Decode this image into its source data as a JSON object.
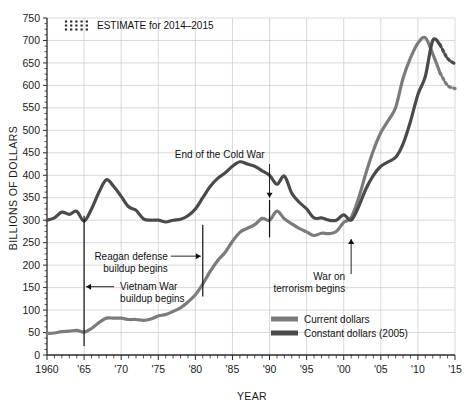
{
  "chart_data": {
    "type": "line",
    "title": "",
    "xlabel": "YEAR",
    "ylabel": "BILLIONS OF DOLLARS",
    "xlim": [
      1960,
      2015
    ],
    "ylim": [
      0,
      750
    ],
    "grid": true,
    "legend_position": "bottom-right",
    "x_tick_labels": [
      "1960",
      "'65",
      "'70",
      "'75",
      "'80",
      "'85",
      "'90",
      "'95",
      "'00",
      "'05",
      "'10",
      "'15"
    ],
    "x_tick_values": [
      1960,
      1965,
      1970,
      1975,
      1980,
      1985,
      1990,
      1995,
      2000,
      2005,
      2010,
      2015
    ],
    "y_tick_labels": [
      "0",
      "50",
      "100",
      "150",
      "200",
      "250",
      "300",
      "350",
      "400",
      "450",
      "500",
      "550",
      "600",
      "650",
      "700",
      "750"
    ],
    "y_tick_values": [
      0,
      50,
      100,
      150,
      200,
      250,
      300,
      350,
      400,
      450,
      500,
      550,
      600,
      650,
      700,
      750
    ],
    "minor_x_tick_interval": 1,
    "series": [
      {
        "name": "Current dollars",
        "color": "#7b7b7b",
        "x": [
          1960,
          1961,
          1962,
          1963,
          1964,
          1965,
          1966,
          1967,
          1968,
          1969,
          1970,
          1971,
          1972,
          1973,
          1974,
          1975,
          1976,
          1977,
          1978,
          1979,
          1980,
          1981,
          1982,
          1983,
          1984,
          1985,
          1986,
          1987,
          1988,
          1989,
          1990,
          1991,
          1992,
          1993,
          1994,
          1995,
          1996,
          1997,
          1998,
          1999,
          2000,
          2001,
          2002,
          2003,
          2004,
          2005,
          2006,
          2007,
          2008,
          2009,
          2010,
          2011,
          2012,
          2013
        ],
        "values": [
          48,
          49,
          52,
          53,
          55,
          51,
          59,
          72,
          82,
          82,
          82,
          79,
          79,
          77,
          80,
          87,
          90,
          97,
          105,
          118,
          134,
          158,
          186,
          210,
          228,
          253,
          273,
          282,
          290,
          304,
          300,
          320,
          303,
          292,
          282,
          274,
          266,
          271,
          270,
          275,
          295,
          306,
          349,
          405,
          455,
          495,
          522,
          551,
          616,
          661,
          694,
          706,
          670,
          627
        ],
        "estimate_x": [
          2013,
          2014,
          2015
        ],
        "estimate_values": [
          627,
          600,
          593
        ],
        "estimate": true
      },
      {
        "name": "Constant dollars (2005)",
        "color": "#4a4a4a",
        "x": [
          1960,
          1961,
          1962,
          1963,
          1964,
          1965,
          1966,
          1967,
          1968,
          1969,
          1970,
          1971,
          1972,
          1973,
          1974,
          1975,
          1976,
          1977,
          1978,
          1979,
          1980,
          1981,
          1982,
          1983,
          1984,
          1985,
          1986,
          1987,
          1988,
          1989,
          1990,
          1991,
          1992,
          1993,
          1994,
          1995,
          1996,
          1997,
          1998,
          1999,
          2000,
          2001,
          2002,
          2003,
          2004,
          2005,
          2006,
          2007,
          2008,
          2009,
          2010,
          2011,
          2012,
          2013
        ],
        "values": [
          300,
          305,
          318,
          313,
          320,
          298,
          325,
          362,
          390,
          375,
          353,
          330,
          322,
          303,
          300,
          300,
          296,
          300,
          302,
          310,
          325,
          350,
          375,
          393,
          405,
          420,
          430,
          425,
          420,
          410,
          400,
          380,
          398,
          360,
          340,
          325,
          305,
          305,
          300,
          300,
          312,
          300,
          330,
          370,
          400,
          420,
          430,
          440,
          470,
          520,
          580,
          620,
          700,
          690
        ],
        "estimate_x": [
          2013,
          2014,
          2015
        ],
        "estimate_values": [
          690,
          660,
          648
        ],
        "estimate": true
      }
    ],
    "annotations": [
      {
        "id": "vietnam-war",
        "label_lines": [
          "Vietnam War",
          "buildup begins"
        ],
        "year": 1965,
        "arrow_direction": "left",
        "rule_top_value": 310,
        "rule_bottom_value": 20
      },
      {
        "id": "reagan-buildup",
        "label_lines": [
          "Reagan defense",
          "buildup begins"
        ],
        "year": 1981,
        "arrow_direction": "right",
        "rule_top_value": 290,
        "rule_bottom_value": 130
      },
      {
        "id": "end-cold-war",
        "label_lines": [
          "End of the Cold War"
        ],
        "year": 1990,
        "arrow_direction": "down",
        "rule_top_value": 440,
        "rule_bottom_value": 260
      },
      {
        "id": "war-on-terrorism",
        "label_lines": [
          "War on",
          "terrorism begins"
        ],
        "year": 2001,
        "arrow_direction": "up",
        "rule_top_value": 270,
        "rule_bottom_value": 170
      }
    ],
    "estimate_key": {
      "label": "ESTIMATE for 2014–2015",
      "swatch": "hatched-dashes"
    }
  }
}
